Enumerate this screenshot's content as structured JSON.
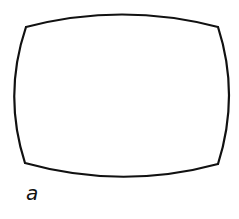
{
  "figure": {
    "label": "a",
    "shape": "barrel-distorted rectangle",
    "stroke_color": "#111111",
    "background_color": "#ffffff",
    "corners": {
      "top_left": [
        26,
        27
      ],
      "top_right": [
        218,
        27
      ],
      "bottom_right": [
        218,
        164
      ],
      "bottom_left": [
        25,
        163
      ]
    }
  }
}
